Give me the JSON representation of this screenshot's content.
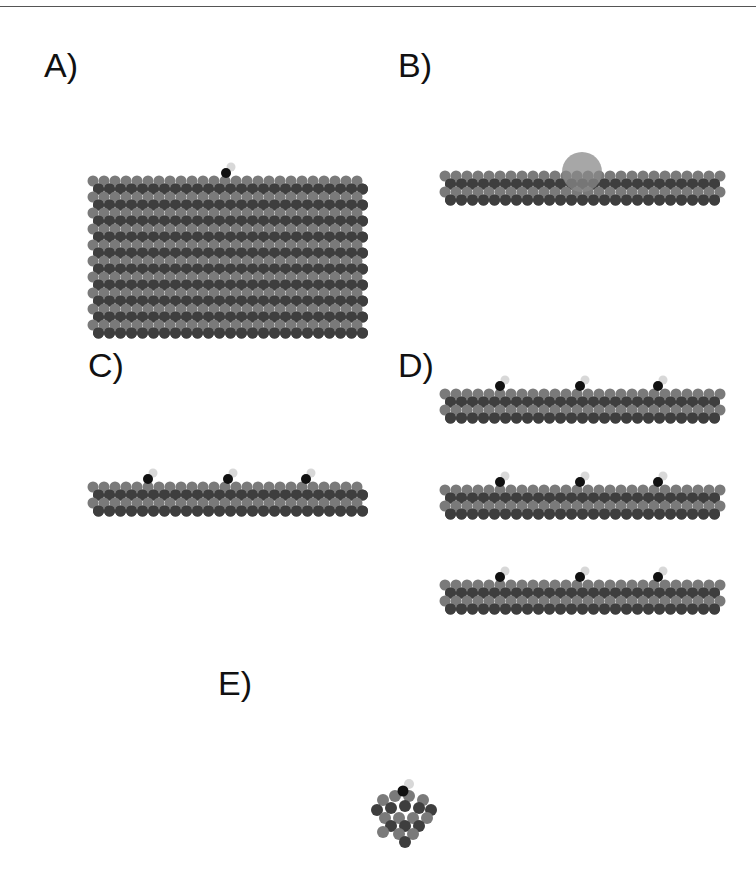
{
  "figure": {
    "panels": [
      {
        "id": "A",
        "label": "A)",
        "description": "Thick slab with one adsorbate"
      },
      {
        "id": "B",
        "label": "B)",
        "description": "Thin slab with large sphere (solvation/cluster)"
      },
      {
        "id": "C",
        "label": "C)",
        "description": "Thin slab with three adsorbates"
      },
      {
        "id": "D",
        "label": "D)",
        "description": "Three stacked thin slabs each with three adsorbates"
      },
      {
        "id": "E",
        "label": "E)",
        "description": "Small cluster with one adsorbate"
      }
    ],
    "colors": {
      "atom_dark": "#3e3e3e",
      "atom_light": "#7a7a7a",
      "adsorbate_dark": "#111111",
      "adsorbate_light": "#d8d8d8",
      "sphere": "#8a8a8a",
      "rule": "#555555"
    }
  }
}
